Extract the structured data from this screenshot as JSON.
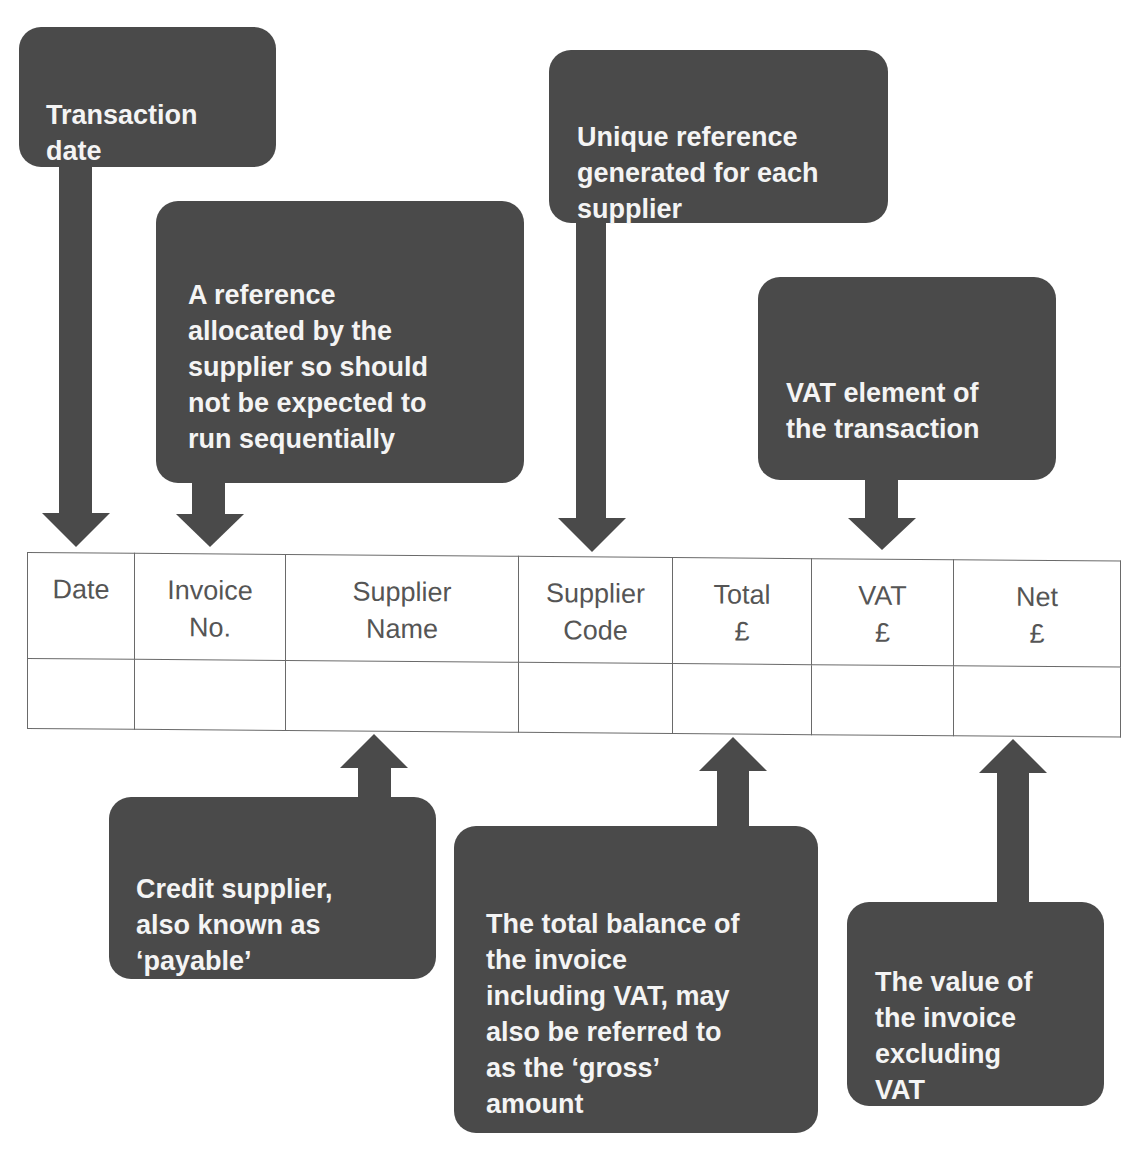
{
  "diagram": {
    "colors": {
      "callout_bg": "#4a4a4a",
      "callout_text": "#f4f4f4",
      "table_border": "#6a6a6a",
      "table_text": "#555555"
    },
    "table": {
      "columns": [
        {
          "label": "Date"
        },
        {
          "label": "Invoice\nNo."
        },
        {
          "label": "Supplier\nName"
        },
        {
          "label": "Supplier\nCode"
        },
        {
          "label": "Total\n£"
        },
        {
          "label": "VAT\n£"
        },
        {
          "label": "Net\n£"
        }
      ],
      "rows": [
        [
          "",
          "",
          "",
          "",
          "",
          "",
          ""
        ]
      ]
    },
    "callouts": {
      "date": {
        "text": "Transaction\ndate",
        "points_to": "Date"
      },
      "invoice_no": {
        "text": "A reference\nallocated by the\nsupplier so should\nnot be expected to\nrun sequentially",
        "points_to": "Invoice No."
      },
      "supplier_code": {
        "text": "Unique reference\ngenerated for each\nsupplier",
        "points_to": "Supplier Code"
      },
      "vat": {
        "text": "VAT element of\nthe transaction",
        "points_to": "VAT £"
      },
      "supplier_name": {
        "text": "Credit supplier,\nalso known as\n‘payable’",
        "points_to": "Supplier Name"
      },
      "total": {
        "text": "The total balance of\nthe invoice\nincluding VAT, may\nalso be referred to\nas the ‘gross’\namount",
        "points_to": "Total £"
      },
      "net": {
        "text": "The value of\nthe invoice\nexcluding\nVAT",
        "points_to": "Net £"
      }
    }
  }
}
